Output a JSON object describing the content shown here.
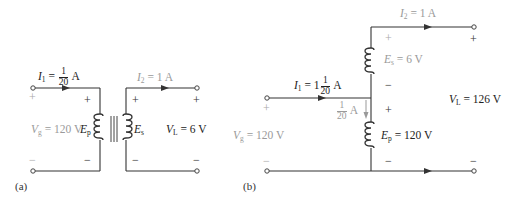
{
  "panel_a": {
    "label": "(a)",
    "I1": {
      "sym": "I",
      "sub": "1",
      "eq": " = ",
      "num": "1",
      "den": "20",
      "unit": " A"
    },
    "I2": {
      "sym": "I",
      "sub": "2",
      "text": " = 1 A"
    },
    "Vg": {
      "sym": "V",
      "sub": "g",
      "text": " = 120 V"
    },
    "Ep": {
      "sym": "E",
      "sub": "p"
    },
    "Es": {
      "sym": "E",
      "sub": "s"
    },
    "VL": {
      "sym": "V",
      "sub": "L",
      "text": " = 6 V"
    },
    "plus": "+",
    "minus": "−"
  },
  "panel_b": {
    "label": "(b)",
    "I1": {
      "sym": "I",
      "sub": "1",
      "eq": " = 1",
      "num": "1",
      "den": "20",
      "unit": " A"
    },
    "Ibranch": {
      "num": "1",
      "den": "20",
      "unit": " A"
    },
    "I2": {
      "sym": "I",
      "sub": "2",
      "text": " = 1 A"
    },
    "Vg": {
      "sym": "V",
      "sub": "g",
      "text": " = 120 V"
    },
    "Es": {
      "sym": "E",
      "sub": "s",
      "text": " = 6 V"
    },
    "Ep": {
      "sym": "E",
      "sub": "p",
      "text": " = 120 V"
    },
    "VL": {
      "sym": "V",
      "sub": "L",
      "text": " = 126 V"
    },
    "plus": "+",
    "minus": "−"
  }
}
